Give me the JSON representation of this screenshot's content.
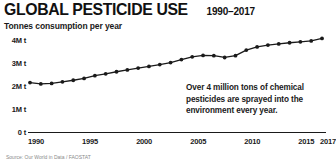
{
  "header": {
    "title": "GLOBAL PESTICIDE USE",
    "years": "1990–2017",
    "subtitle": "Tonnes consumption per year"
  },
  "annotation": {
    "text": "Over 4 million tons of chemical pesticides are sprayed into the environment every year."
  },
  "source": {
    "text": "Source: Our World in Data / FAOSTAT"
  },
  "chart_data": {
    "type": "line",
    "title": "GLOBAL PESTICIDE USE",
    "subtitle": "1990–2017",
    "xlabel": "",
    "ylabel": "Tonnes consumption per year",
    "ylim": [
      0,
      4000000
    ],
    "xlim": [
      1990,
      2017
    ],
    "grid": false,
    "legend": null,
    "y_tick_labels": [
      "4M t",
      "3M t",
      "2M t",
      "1M t",
      "0 t"
    ],
    "y_tick_values": [
      4000000,
      3000000,
      2000000,
      1000000,
      0
    ],
    "x_tick_labels": [
      "1990",
      "1995",
      "2000",
      "2005",
      "2010",
      "2015",
      "2017"
    ],
    "x_tick_values": [
      1990,
      1995,
      2000,
      2005,
      2010,
      2015,
      2017
    ],
    "marker": "circle",
    "line_color": "#1a1a1a",
    "x": [
      1990,
      1991,
      1992,
      1993,
      1994,
      1995,
      1996,
      1997,
      1998,
      1999,
      2000,
      2001,
      2002,
      2003,
      2004,
      2005,
      2006,
      2007,
      2008,
      2009,
      2010,
      2011,
      2012,
      2013,
      2014,
      2015,
      2016,
      2017
    ],
    "values": [
      2150000,
      2090000,
      2110000,
      2180000,
      2250000,
      2330000,
      2450000,
      2530000,
      2620000,
      2700000,
      2780000,
      2850000,
      2930000,
      3020000,
      3150000,
      3270000,
      3330000,
      3320000,
      3240000,
      3320000,
      3560000,
      3700000,
      3780000,
      3830000,
      3880000,
      3920000,
      3960000,
      4070000
    ]
  }
}
